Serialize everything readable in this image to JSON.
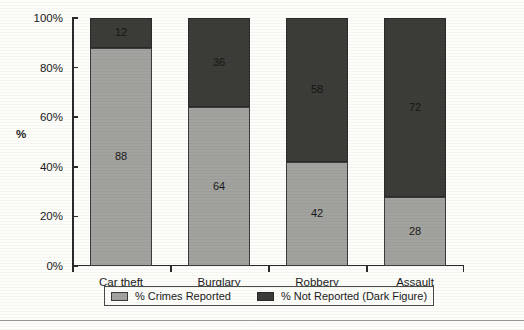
{
  "chart_data": {
    "type": "bar",
    "subtype": "stacked-100-percent",
    "title": "",
    "xlabel": "",
    "ylabel": "%",
    "ylim": [
      0,
      100
    ],
    "grid": false,
    "legend_position": "bottom",
    "categories": [
      "Car theft",
      "Burglary",
      "Robbery",
      "Assault"
    ],
    "ytick_labels": [
      "0%",
      "20%",
      "40%",
      "60%",
      "80%",
      "100%"
    ],
    "ytick_values": [
      0,
      20,
      40,
      60,
      80,
      100
    ],
    "series": [
      {
        "name": "% Crimes Reported",
        "color": "#a2a29e",
        "values": [
          88,
          64,
          42,
          28
        ]
      },
      {
        "name": "% Not Reported (Dark Figure)",
        "color": "#3c3c38",
        "values": [
          12,
          36,
          58,
          72
        ]
      }
    ]
  },
  "axis": {
    "y_title": "%"
  },
  "legend": {
    "items": [
      {
        "label": "% Crimes Reported",
        "swatch": "light"
      },
      {
        "label": "% Not Reported (Dark Figure)",
        "swatch": "dark"
      }
    ]
  }
}
